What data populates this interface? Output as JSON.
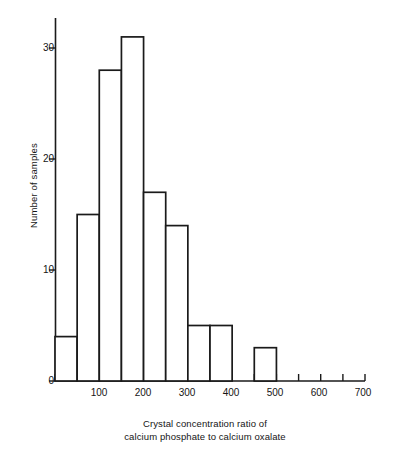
{
  "chart_data": {
    "type": "bar",
    "title": "",
    "subtitle": "",
    "xlabel_line1": "Crystal concentration ratio of",
    "xlabel_line2": "calcium phosphate to calcium oxalate",
    "ylabel": "Number of samples",
    "bin_width": 50,
    "bin_edges": [
      0,
      50,
      100,
      150,
      200,
      250,
      300,
      350,
      400,
      450,
      500,
      550,
      600,
      650,
      700
    ],
    "categories": [
      "0-50",
      "50-100",
      "100-150",
      "150-200",
      "200-250",
      "250-300",
      "300-350",
      "350-400",
      "400-450",
      "450-500",
      "500-550",
      "550-600",
      "600-650",
      "650-700"
    ],
    "values": [
      4,
      15,
      28,
      31,
      17,
      14,
      5,
      5,
      0,
      3,
      0,
      0,
      0,
      0
    ],
    "xlim": [
      0,
      700
    ],
    "ylim": [
      0,
      34
    ],
    "xticks": [
      0,
      50,
      100,
      150,
      200,
      250,
      300,
      350,
      400,
      450,
      500,
      550,
      600,
      650,
      700
    ],
    "xtick_labels": [
      "",
      "",
      "100",
      "",
      "200",
      "",
      "300",
      "",
      "400",
      "",
      "500",
      "",
      "600",
      "",
      "700"
    ],
    "yticks": [
      0,
      10,
      20,
      30
    ],
    "ytick_labels": [
      "0",
      "10",
      "20",
      "30"
    ],
    "grid": false,
    "legend": null,
    "total_samples": 108,
    "colors": {
      "axis": "#1a1a1a",
      "bar_stroke": "#1a1a1a",
      "bar_fill": "#ffffff",
      "background": "#ffffff",
      "text": "#151515"
    }
  }
}
